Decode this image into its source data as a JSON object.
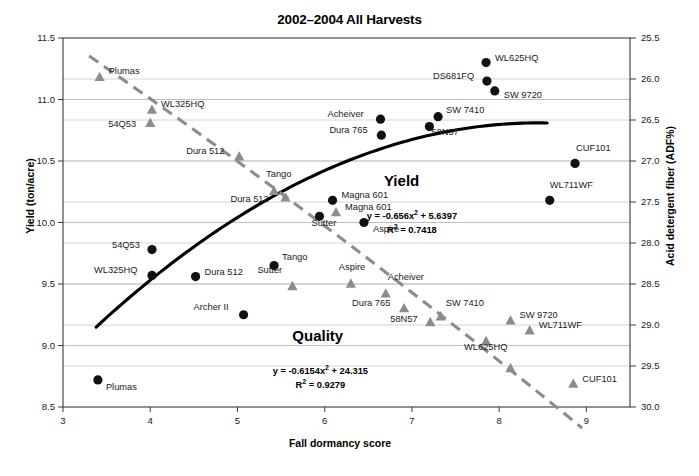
{
  "chart_data": {
    "type": "scatter",
    "title": "2002–2004 All Harvests",
    "xlabel": "Fall dormancy score",
    "ylabel": "Yield (ton/acre)",
    "y2label": "Acid detergent fiber (ADF%)",
    "xlim": [
      3,
      9.5
    ],
    "ylim": [
      8.5,
      11.5
    ],
    "y2lim": [
      30.0,
      25.5
    ],
    "y2_inverted": true,
    "grid": true,
    "legend_position": "none",
    "xticks": [
      "3",
      "4",
      "5",
      "6",
      "7",
      "8",
      "9"
    ],
    "xtick_values": [
      3,
      4,
      5,
      6,
      7,
      8,
      9
    ],
    "yticks": [
      "8.5",
      "9.0",
      "9.5",
      "10.0",
      "10.5",
      "11.0",
      "11.5"
    ],
    "ytick_values": [
      8.5,
      9.0,
      9.5,
      10.0,
      10.5,
      11.0,
      11.5
    ],
    "y2ticks": [
      "25.5",
      "26.0",
      "26.5",
      "27.0",
      "27.5",
      "28.0",
      "28.5",
      "29.0",
      "29.5",
      "30.0"
    ],
    "y2tick_values": [
      25.5,
      26.0,
      26.5,
      27.0,
      27.5,
      28.0,
      28.5,
      29.0,
      29.5,
      30.0
    ],
    "series": [
      {
        "name": "Yield",
        "marker": "circle",
        "color": "#111111",
        "axis": "left",
        "annotation": "Yield",
        "equation": "y = -0.656x",
        "equation_exp": "2",
        "equation_tail": " + 5.6397",
        "r2": "R",
        "r2_exp": "2",
        "r2_tail": " = 0.7418",
        "trend": "solid",
        "points": [
          {
            "label": "Plumas",
            "x": 3.4,
            "y": 8.72,
            "label_dx": 8,
            "label_dy": 8
          },
          {
            "label": "54Q53",
            "x": 4.02,
            "y": 9.78,
            "label_dx": -40,
            "label_dy": -4
          },
          {
            "label": "WL325HQ",
            "x": 4.02,
            "y": 9.57,
            "label_dx": -58,
            "label_dy": -4
          },
          {
            "label": "Dura 512",
            "x": 4.52,
            "y": 9.56,
            "label_dx": 9,
            "label_dy": -4
          },
          {
            "label": "Archer II",
            "x": 5.07,
            "y": 9.25,
            "label_dx": -50,
            "label_dy": -7
          },
          {
            "label": "Tango",
            "x": 5.42,
            "y": 9.65,
            "label_dx": 8,
            "label_dy": -8
          },
          {
            "label": "Sutter",
            "x": 5.94,
            "y": 10.05,
            "label_dx": -8,
            "label_dy": 8
          },
          {
            "label": "Magna 601",
            "x": 6.09,
            "y": 10.18,
            "label_dx": 9,
            "label_dy": -4
          },
          {
            "label": "Aspire",
            "x": 6.45,
            "y": 10.0,
            "label_dx": 9,
            "label_dy": 7
          },
          {
            "label": "Dura 765",
            "x": 6.65,
            "y": 10.71,
            "label_dx": -52,
            "label_dy": -4
          },
          {
            "label": "Acheiver",
            "x": 6.64,
            "y": 10.84,
            "label_dx": -53,
            "label_dy": -4
          },
          {
            "label": "58N57",
            "x": 7.2,
            "y": 10.78,
            "label_dx": 2,
            "label_dy": 6
          },
          {
            "label": "SW 7410",
            "x": 7.3,
            "y": 10.86,
            "label_dx": 8,
            "label_dy": -6
          },
          {
            "label": "DS681FQ",
            "x": 7.86,
            "y": 11.15,
            "label_dx": -54,
            "label_dy": -4
          },
          {
            "label": "SW 9720",
            "x": 7.95,
            "y": 11.07,
            "label_dx": 9,
            "label_dy": 5
          },
          {
            "label": "WL625HQ",
            "x": 7.85,
            "y": 11.3,
            "label_dx": 9,
            "label_dy": -4
          },
          {
            "label": "CUF101",
            "x": 8.87,
            "y": 10.48,
            "label_dx": 1,
            "label_dy": -14
          },
          {
            "label": "WL711WF",
            "x": 8.58,
            "y": 10.18,
            "label_dx": 0,
            "label_dy": -14
          }
        ]
      },
      {
        "name": "Quality",
        "marker": "triangle",
        "color": "#8c8c8c",
        "axis": "right",
        "annotation": "Quality",
        "equation": "y = -0.6154x",
        "equation_exp": "2",
        "equation_tail": " + 24.315",
        "r2": "R",
        "r2_exp": "2",
        "r2_tail": " = 0.9279",
        "trend": "dashed",
        "points": [
          {
            "label": "Plumas",
            "x": 3.42,
            "y2": 25.98,
            "label_dx": 9,
            "label_dy": -5
          },
          {
            "label": "WL325HQ",
            "x": 4.02,
            "y2": 26.38,
            "label_dx": 9,
            "label_dy": -5
          },
          {
            "label": "54Q53",
            "x": 4.0,
            "y2": 26.54,
            "label_dx": -42,
            "label_dy": 2
          },
          {
            "label": "Dura 512",
            "x": 5.02,
            "y2": 26.95,
            "label_dx": -53,
            "label_dy": -5
          },
          {
            "label": "Dura 512",
            "x": 5.55,
            "y2": 27.45,
            "label_dx": -55,
            "label_dy": 2
          },
          {
            "label": "Tango",
            "x": 5.42,
            "y2": 27.37,
            "label_dx": -8,
            "label_dy": -16
          },
          {
            "label": "Magna 601",
            "x": 6.13,
            "y2": 27.63,
            "label_dx": 9,
            "label_dy": -5
          },
          {
            "label": "Sutter",
            "x": 5.63,
            "y2": 28.53,
            "label_dx": -35,
            "label_dy": -15
          },
          {
            "label": "Aspire",
            "x": 6.3,
            "y2": 28.5,
            "label_dx": -12,
            "label_dy": -16
          },
          {
            "label": "Acheiver",
            "x": 6.7,
            "y2": 28.62,
            "label_dx": 2,
            "label_dy": -16
          },
          {
            "label": "Dura 765",
            "x": 6.91,
            "y2": 28.8,
            "label_dx": -52,
            "label_dy": -5
          },
          {
            "label": "58N57",
            "x": 7.21,
            "y2": 28.97,
            "label_dx": -40,
            "label_dy": -3
          },
          {
            "label": "SW 7410",
            "x": 7.33,
            "y2": 28.9,
            "label_dx": 5,
            "label_dy": -13
          },
          {
            "label": "WL625HQ",
            "x": 7.85,
            "y2": 29.2,
            "label_dx": -22,
            "label_dy": 7
          },
          {
            "label": "SW 9720",
            "x": 8.13,
            "y2": 28.95,
            "label_dx": 9,
            "label_dy": -5
          },
          {
            "label": "WL711WF",
            "x": 8.35,
            "y2": 29.07,
            "label_dx": 9,
            "label_dy": -5
          },
          {
            "label": "",
            "x": 8.13,
            "y2": 29.53,
            "label_dx": 0,
            "label_dy": 0
          },
          {
            "label": "CUF101",
            "x": 8.85,
            "y2": 29.72,
            "label_dx": 9,
            "label_dy": -4
          }
        ]
      }
    ],
    "annotations": [
      {
        "text": "Yield",
        "x": 7.0,
        "y": 10.33,
        "style": "big"
      },
      {
        "text": "Quality",
        "x": 5.95,
        "y": 9.07,
        "style": "big"
      }
    ]
  }
}
